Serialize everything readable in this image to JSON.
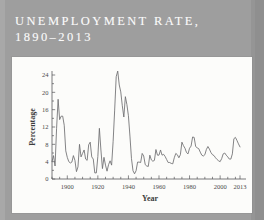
{
  "page": {
    "background_color": "#9e9e9e",
    "panel_color": "#fcfcfa"
  },
  "title": {
    "line1": "UNEMPLOYMENT RATE,",
    "line2": "1890–2013",
    "color": "#fbfbfb"
  },
  "chart_data": {
    "type": "line",
    "xlabel": "Year",
    "ylabel": "Percentage",
    "xlim": [
      1890,
      2013
    ],
    "ylim": [
      0,
      24
    ],
    "grid": false,
    "legend": null,
    "line_color": "#6e6e70",
    "xticks": [
      1900,
      1920,
      1940,
      1960,
      1980,
      2000,
      2013
    ],
    "xtick_labels": [
      "1900",
      "1920",
      "1940",
      "1960",
      "1980",
      "2000",
      "2013"
    ],
    "yticks": [
      0,
      4,
      8,
      12,
      16,
      20,
      24
    ],
    "ytick_labels": [
      "0",
      "4",
      "8",
      "12",
      "16",
      "20",
      "24"
    ],
    "minor_tick_interval_x": 5,
    "minor_tick_interval_y": 2,
    "series": [
      {
        "name": "Unemployment rate",
        "x": [
          1890,
          1891,
          1892,
          1893,
          1894,
          1895,
          1896,
          1897,
          1898,
          1899,
          1900,
          1901,
          1902,
          1903,
          1904,
          1905,
          1906,
          1907,
          1908,
          1909,
          1910,
          1911,
          1912,
          1913,
          1914,
          1915,
          1916,
          1917,
          1918,
          1919,
          1920,
          1921,
          1922,
          1923,
          1924,
          1925,
          1926,
          1927,
          1928,
          1929,
          1930,
          1931,
          1932,
          1933,
          1934,
          1935,
          1936,
          1937,
          1938,
          1939,
          1940,
          1941,
          1942,
          1943,
          1944,
          1945,
          1946,
          1947,
          1948,
          1949,
          1950,
          1951,
          1952,
          1953,
          1954,
          1955,
          1956,
          1957,
          1958,
          1959,
          1960,
          1961,
          1962,
          1963,
          1964,
          1965,
          1966,
          1967,
          1968,
          1969,
          1970,
          1971,
          1972,
          1973,
          1974,
          1975,
          1976,
          1977,
          1978,
          1979,
          1980,
          1981,
          1982,
          1983,
          1984,
          1985,
          1986,
          1987,
          1988,
          1989,
          1990,
          1991,
          1992,
          1993,
          1994,
          1995,
          1996,
          1997,
          1998,
          1999,
          2000,
          2001,
          2002,
          2003,
          2004,
          2005,
          2006,
          2007,
          2008,
          2009,
          2010,
          2011,
          2012,
          2013
        ],
        "y": [
          4.0,
          5.4,
          3.0,
          11.7,
          18.4,
          13.7,
          14.5,
          14.5,
          12.4,
          6.5,
          5.0,
          4.0,
          3.7,
          3.9,
          5.4,
          4.3,
          1.7,
          2.8,
          8.0,
          5.1,
          5.9,
          6.7,
          4.6,
          4.3,
          7.9,
          8.5,
          5.1,
          4.6,
          1.4,
          1.4,
          5.2,
          11.7,
          6.7,
          2.4,
          5.0,
          3.2,
          1.8,
          3.3,
          4.2,
          3.2,
          8.7,
          15.9,
          23.6,
          24.9,
          21.7,
          20.1,
          16.9,
          14.3,
          19.0,
          17.2,
          14.6,
          9.9,
          4.7,
          1.9,
          1.2,
          1.9,
          3.9,
          3.9,
          3.8,
          5.9,
          5.3,
          3.3,
          3.0,
          2.9,
          5.5,
          4.4,
          4.1,
          4.3,
          6.8,
          5.5,
          5.5,
          6.7,
          5.5,
          5.7,
          5.2,
          4.5,
          3.8,
          3.8,
          3.6,
          3.5,
          4.9,
          5.9,
          5.6,
          4.9,
          5.6,
          8.5,
          7.7,
          7.1,
          6.1,
          5.8,
          7.1,
          7.6,
          9.7,
          9.6,
          7.5,
          7.2,
          7.0,
          6.2,
          5.5,
          5.3,
          5.6,
          6.8,
          7.5,
          6.9,
          6.1,
          5.6,
          5.4,
          4.9,
          4.5,
          4.2,
          4.0,
          4.7,
          5.8,
          6.0,
          5.5,
          5.1,
          4.6,
          4.6,
          5.8,
          9.3,
          9.6,
          8.9,
          8.1,
          7.4
        ],
        "notable_points": [
          {
            "year": 1933,
            "value": 24.9,
            "label": "Great Depression peak"
          },
          {
            "year": 1944,
            "value": 1.2,
            "label": "WWII low"
          },
          {
            "year": 2009,
            "value": 9.3,
            "label": "Great Recession"
          },
          {
            "year": 2013,
            "value": 7.4,
            "label": "final value"
          }
        ]
      }
    ]
  }
}
